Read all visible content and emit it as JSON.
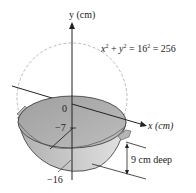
{
  "diagram": {
    "y_axis_label": "y (cm)",
    "x_axis_label": "x (cm)",
    "equation": {
      "x": "x",
      "plus": "+",
      "y": "y",
      "minus_eq": "=",
      "const": "16",
      "eq2": "=",
      "rhs": "256",
      "exp": "2"
    },
    "tick_labels": {
      "zero": "0",
      "minus_seven": "−7",
      "minus_sixteen": "−16"
    },
    "depth_label": "9 cm deep",
    "colors": {
      "bowl_fill": "#b9b9b9",
      "bowl_inner": "#a8a8a8",
      "bowl_light": "#d6d6d6",
      "line": "#222222",
      "dashed_circle": "#aaaaaa"
    }
  }
}
